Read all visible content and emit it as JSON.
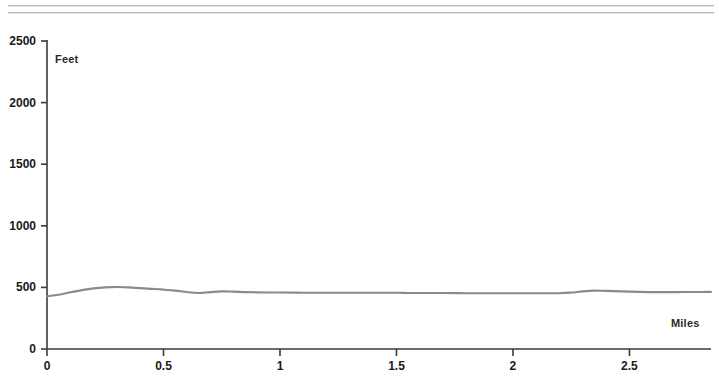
{
  "page": {
    "background_color": "#ffffff",
    "scan_rules": [
      {
        "name": "top-rule-1",
        "color": "#b9b9b9"
      },
      {
        "name": "top-rule-2",
        "color": "#b9b9b9"
      }
    ]
  },
  "chart_data": {
    "type": "line",
    "title": "",
    "subtitle": "",
    "xlabel": "Miles",
    "ylabel": "Feet",
    "xlim": [
      0,
      2.85
    ],
    "ylim": [
      0,
      2500
    ],
    "grid": false,
    "legend": null,
    "line_color": "#8a8a8a",
    "axis_color": "#3a3a3a",
    "x_ticks": [
      0,
      0.5,
      1,
      1.5,
      2,
      2.5
    ],
    "x_tick_labels": [
      "0",
      "0.5",
      "1",
      "1.5",
      "2",
      "2.5"
    ],
    "y_ticks": [
      0,
      500,
      1000,
      1500,
      2000,
      2500
    ],
    "y_tick_labels": [
      "0",
      "500",
      "1000",
      "1500",
      "2000",
      "2500"
    ],
    "series": [
      {
        "name": "Elevation profile",
        "x": [
          0.0,
          0.05,
          0.1,
          0.15,
          0.2,
          0.25,
          0.3,
          0.35,
          0.4,
          0.45,
          0.5,
          0.55,
          0.6,
          0.65,
          0.7,
          0.75,
          0.8,
          0.85,
          0.9,
          0.95,
          1.0,
          1.1,
          1.2,
          1.3,
          1.4,
          1.5,
          1.55,
          1.6,
          1.65,
          1.7,
          1.8,
          1.9,
          2.0,
          2.1,
          2.2,
          2.25,
          2.3,
          2.35,
          2.4,
          2.5,
          2.6,
          2.7,
          2.8,
          2.85
        ],
        "values": [
          428,
          440,
          460,
          478,
          492,
          500,
          503,
          500,
          494,
          488,
          482,
          474,
          462,
          455,
          462,
          468,
          466,
          462,
          460,
          459,
          458,
          457,
          457,
          456,
          456,
          456,
          455,
          455,
          454,
          454,
          453,
          452,
          452,
          452,
          453,
          458,
          468,
          474,
          472,
          466,
          462,
          462,
          463,
          464
        ]
      }
    ],
    "annotations": []
  },
  "labels": {
    "feet": "Feet",
    "miles": "Miles"
  }
}
